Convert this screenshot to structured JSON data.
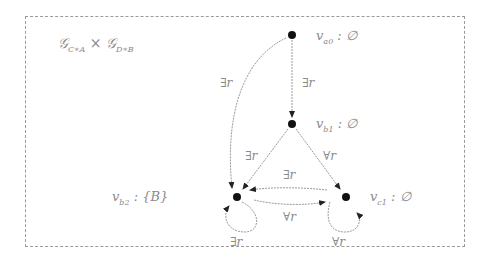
{
  "diagram": {
    "title": {
      "left": "𝒢",
      "left_sub": "C∗A",
      "op": " × ",
      "right": "𝒢",
      "right_sub": "D∗B"
    },
    "nodes": [
      {
        "id": "va0",
        "name": "v",
        "sub": "a0",
        "label": " : ∅",
        "x": 292,
        "y": 35
      },
      {
        "id": "vb1",
        "name": "v",
        "sub": "b1",
        "label": " : ∅",
        "x": 292,
        "y": 124
      },
      {
        "id": "vb2",
        "name": "v",
        "sub": "b2",
        "label": " : {B}",
        "x": 237,
        "y": 197
      },
      {
        "id": "vc1",
        "name": "v",
        "sub": "c1",
        "label": " : ∅",
        "x": 346,
        "y": 197
      }
    ],
    "edges": [
      {
        "from": "va0",
        "to": "vb2",
        "label": "∃r"
      },
      {
        "from": "va0",
        "to": "vb1",
        "label": "∃r"
      },
      {
        "from": "vb1",
        "to": "vb2",
        "label": "∃r"
      },
      {
        "from": "vb1",
        "to": "vc1",
        "label": "∀r"
      },
      {
        "from": "vc1",
        "to": "vb2",
        "label": "∃r"
      },
      {
        "from": "vb2",
        "to": "vc1",
        "label": "∀r"
      },
      {
        "from": "vb2",
        "to": "vb2",
        "label": "∃r"
      },
      {
        "from": "vc1",
        "to": "vc1",
        "label": "∀r"
      }
    ],
    "colors": {
      "node": "#111111",
      "edge": "#9a9a9a",
      "text": "#8a8a8a",
      "frame": "#9a9a9a"
    }
  }
}
